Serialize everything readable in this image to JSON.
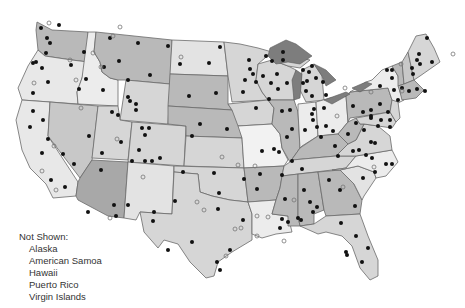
{
  "map": {
    "title": "United States map with site locations",
    "colors": {
      "light": "#ececec",
      "light_medium": "#d6d6d6",
      "medium": "#b9b9b9",
      "dark": "#999999",
      "lake": "#7d7d7d",
      "dot_filled": "#111111",
      "dot_open": "#888888"
    },
    "legend": {
      "heading": "Not Shown:",
      "items": [
        "Alaska",
        "American Samoa",
        "Hawaii",
        "Puerto Rico",
        "Virgin Islands"
      ]
    }
  }
}
